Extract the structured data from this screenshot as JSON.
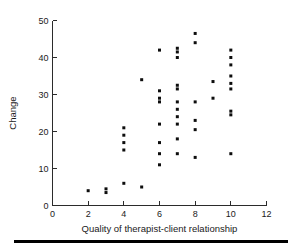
{
  "chart_data": {
    "type": "scatter",
    "title": "",
    "xlabel": "Quality of therapist-client relationship",
    "ylabel": "Change",
    "xlim": [
      0,
      12
    ],
    "ylim": [
      0,
      50
    ],
    "xticks": [
      0,
      2,
      4,
      6,
      8,
      10,
      12
    ],
    "yticks": [
      0,
      10,
      20,
      30,
      40,
      50
    ],
    "xtick_labels": [
      "0",
      "2",
      "4",
      "6",
      "8",
      "10",
      "12"
    ],
    "ytick_labels": [
      "0",
      "10",
      "20",
      "30",
      "40",
      "50"
    ],
    "grid": false,
    "legend": false,
    "marker": "square",
    "marker_color": "#0d0d0d",
    "points": [
      {
        "x": 2,
        "y": 4
      },
      {
        "x": 3,
        "y": 4.5
      },
      {
        "x": 3,
        "y": 3.5
      },
      {
        "x": 4,
        "y": 6
      },
      {
        "x": 4,
        "y": 21
      },
      {
        "x": 4,
        "y": 19
      },
      {
        "x": 4,
        "y": 17
      },
      {
        "x": 4,
        "y": 15
      },
      {
        "x": 5,
        "y": 5
      },
      {
        "x": 5,
        "y": 34
      },
      {
        "x": 6,
        "y": 42
      },
      {
        "x": 6,
        "y": 31
      },
      {
        "x": 6,
        "y": 29
      },
      {
        "x": 6,
        "y": 28
      },
      {
        "x": 6,
        "y": 22
      },
      {
        "x": 6,
        "y": 17
      },
      {
        "x": 6,
        "y": 14
      },
      {
        "x": 6,
        "y": 11
      },
      {
        "x": 7,
        "y": 42.5
      },
      {
        "x": 7,
        "y": 41.5
      },
      {
        "x": 7,
        "y": 40
      },
      {
        "x": 7,
        "y": 32.5
      },
      {
        "x": 7,
        "y": 31.5
      },
      {
        "x": 7,
        "y": 28
      },
      {
        "x": 7,
        "y": 26
      },
      {
        "x": 7,
        "y": 24
      },
      {
        "x": 7,
        "y": 22
      },
      {
        "x": 7,
        "y": 18
      },
      {
        "x": 7,
        "y": 14
      },
      {
        "x": 8,
        "y": 46.5
      },
      {
        "x": 8,
        "y": 44
      },
      {
        "x": 8,
        "y": 28
      },
      {
        "x": 8,
        "y": 23
      },
      {
        "x": 8,
        "y": 20.5
      },
      {
        "x": 8,
        "y": 13
      },
      {
        "x": 9,
        "y": 33.5
      },
      {
        "x": 9,
        "y": 29
      },
      {
        "x": 10,
        "y": 42
      },
      {
        "x": 10,
        "y": 40
      },
      {
        "x": 10,
        "y": 38
      },
      {
        "x": 10,
        "y": 35
      },
      {
        "x": 10,
        "y": 33
      },
      {
        "x": 10,
        "y": 31.5
      },
      {
        "x": 10,
        "y": 25.5
      },
      {
        "x": 10,
        "y": 24.5
      },
      {
        "x": 10,
        "y": 14
      }
    ]
  },
  "figure": {
    "footer_rule": ""
  }
}
